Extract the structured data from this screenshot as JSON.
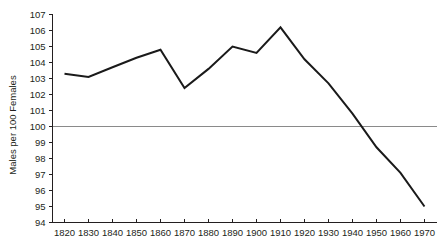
{
  "chart_data": {
    "type": "line",
    "title": "",
    "xlabel": "",
    "ylabel": "Males per 100 Females",
    "x": [
      1820,
      1830,
      1840,
      1850,
      1860,
      1870,
      1880,
      1890,
      1900,
      1910,
      1920,
      1930,
      1940,
      1950,
      1960,
      1970
    ],
    "values": [
      103.3,
      103.1,
      103.7,
      104.3,
      104.8,
      102.4,
      103.6,
      105.0,
      104.6,
      106.2,
      104.2,
      102.7,
      100.8,
      98.7,
      97.1,
      95.0
    ],
    "series": [
      {
        "name": "Sex ratio",
        "values": [
          103.3,
          103.1,
          103.7,
          104.3,
          104.8,
          102.4,
          103.6,
          105.0,
          104.6,
          106.2,
          104.2,
          102.7,
          100.8,
          98.7,
          97.1,
          95.0
        ]
      }
    ],
    "xlim": [
      1815,
      1975
    ],
    "ylim": [
      94,
      107
    ],
    "x_ticks": [
      "1820",
      "1830",
      "1840",
      "1850",
      "1860",
      "1870",
      "1880",
      "1890",
      "1900",
      "1910",
      "1920",
      "1930",
      "1940",
      "1950",
      "1960",
      "1970"
    ],
    "y_ticks": [
      "94",
      "95",
      "96",
      "97",
      "98",
      "99",
      "100",
      "101",
      "102",
      "103",
      "104",
      "105",
      "106",
      "107"
    ],
    "grid": false,
    "legend": "none",
    "annotations": [
      {
        "name": "parity-reference-line",
        "type": "hline",
        "y": 100,
        "color": "#8a8a8a"
      }
    ],
    "colors": {
      "line": "#1a1a1a",
      "axis": "#231f20",
      "reference": "#8a8a8a",
      "background": "#ffffff"
    }
  }
}
